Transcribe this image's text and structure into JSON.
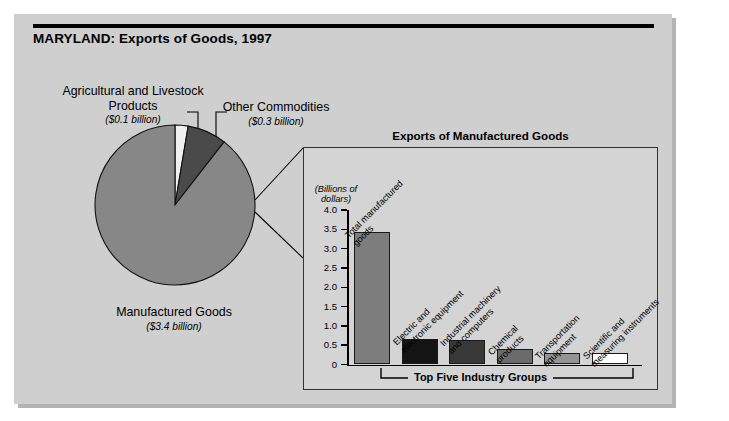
{
  "title": "MARYLAND: Exports of Goods, 1997",
  "colors": {
    "figure_background": "#cfcfcf",
    "panel_background": "#d4d4d4",
    "pie_manufactured": "#878787",
    "pie_other": "#4a4a4a",
    "pie_agricultural": "#f0f0f0",
    "bar_total": "#7d7d7d",
    "bar_electric": "#141414",
    "bar_industrial": "#383838",
    "bar_chemical": "#6b6b6b",
    "bar_transportation": "#949494",
    "bar_scientific": "#ffffff",
    "outline": "#000000"
  },
  "pie": {
    "labels": {
      "agricultural": {
        "name": "Agricultural and Livestock Products",
        "amount": "($0.1 billion)"
      },
      "other": {
        "name": "Other Commodities",
        "amount": "($0.3 billion)"
      },
      "manufactured": {
        "name": "Manufactured Goods",
        "amount": "($3.4 billion)"
      }
    }
  },
  "inset": {
    "title": "Exports of Manufactured Goods",
    "axis_caption": "(Billions of dollars)",
    "bracket_label": "Top Five Industry Groups"
  },
  "chart_data": [
    {
      "type": "pie",
      "title": "MARYLAND: Exports of Goods, 1997",
      "unit": "billions of dollars",
      "categories": [
        "Agricultural and Livestock Products",
        "Other Commodities",
        "Manufactured Goods"
      ],
      "values": [
        0.1,
        0.3,
        3.4
      ],
      "value_labels": [
        "($0.1 billion)",
        "($0.3 billion)",
        "($3.4 billion)"
      ],
      "colors": [
        "#f0f0f0",
        "#4a4a4a",
        "#878787"
      ],
      "start_angle_deg": 0,
      "direction": "clockwise",
      "legend": "labels with leader lines"
    },
    {
      "type": "bar",
      "title": "Exports of Manufactured Goods",
      "ylabel": "(Billions of dollars)",
      "xlabel": "",
      "ylim": [
        0,
        4.0
      ],
      "ytick_labels": [
        "4.0",
        "3.5",
        "3.0",
        "2.5",
        "2.0",
        "1.5",
        "1.0",
        "0.5",
        "0"
      ],
      "ytick_values": [
        4.0,
        3.5,
        3.0,
        2.5,
        2.0,
        1.5,
        1.0,
        0.5,
        0
      ],
      "grid": false,
      "legend": "none",
      "annotation": "Top Five Industry Groups",
      "annotation_covers": [
        "Electric and electronic equipment",
        "Industrial machinery and computers",
        "Chemical products",
        "Transportation equipment",
        "Scientific and measuring instruments"
      ],
      "categories": [
        "Total manufactured goods",
        "Electric and electronic equipment",
        "Industrial machinery and computers",
        "Chemical products",
        "Transportation equipment",
        "Scientific and measuring instruments"
      ],
      "values": [
        3.42,
        0.67,
        0.63,
        0.39,
        0.31,
        0.31
      ],
      "bar_colors": [
        "#7d7d7d",
        "#141414",
        "#383838",
        "#6b6b6b",
        "#949494",
        "#ffffff"
      ]
    }
  ]
}
